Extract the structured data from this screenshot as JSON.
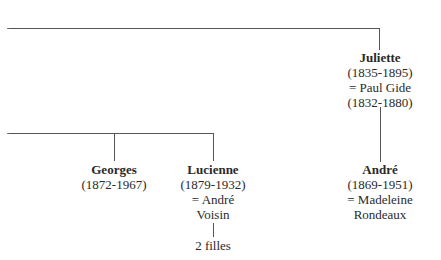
{
  "diagram": {
    "type": "family-tree",
    "nodes": {
      "juliette": {
        "name": "Juliette",
        "dates": "(1835-1895)",
        "spouse": "=  Paul Gide",
        "spouse_dates": "(1832-1880)"
      },
      "andre": {
        "name": "André",
        "dates": "(1869-1951)",
        "spouse": "=  Madeleine",
        "spouse_line2": "Rondeaux"
      },
      "georges": {
        "name": "Georges",
        "dates": "(1872-1967)"
      },
      "lucienne": {
        "name": "Lucienne",
        "dates": "(1879-1932)",
        "spouse": "=  André",
        "spouse_line2": "Voisin",
        "children": "2 filles"
      }
    },
    "edges": [
      {
        "from": "parent-offscreen",
        "to": "juliette"
      },
      {
        "from": "juliette",
        "to": "andre"
      },
      {
        "from": "parent-offscreen",
        "to": "georges"
      },
      {
        "from": "parent-offscreen",
        "to": "lucienne"
      },
      {
        "from": "lucienne",
        "to": "lucienne-children"
      }
    ],
    "line_color": "#555555",
    "text_color": "#2a2a2a"
  }
}
